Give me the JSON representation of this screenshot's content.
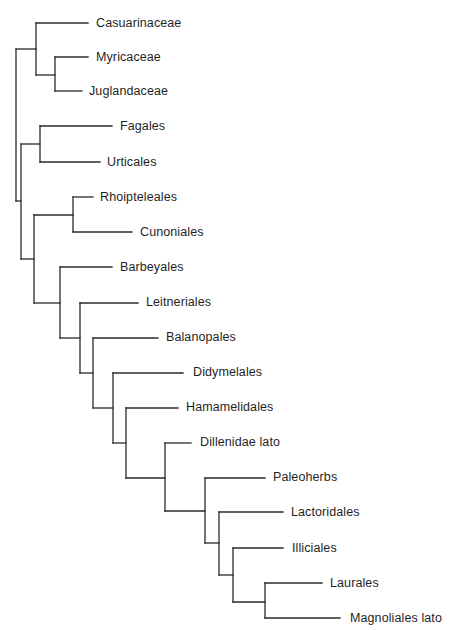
{
  "diagram": {
    "type": "cladogram",
    "line_color": "#2a2a2a",
    "text_color": "#1f1f1f",
    "taxa": [
      {
        "label": "Casuarinaceae",
        "x": 96,
        "y": 23
      },
      {
        "label": "Myricaceae",
        "x": 96,
        "y": 57
      },
      {
        "label": "Juglandaceae",
        "x": 89,
        "y": 91
      },
      {
        "label": "Fagales",
        "x": 120,
        "y": 126
      },
      {
        "label": "Urticales",
        "x": 107,
        "y": 162
      },
      {
        "label": "Rhoipteleales",
        "x": 100,
        "y": 197
      },
      {
        "label": "Cunoniales",
        "x": 140,
        "y": 232
      },
      {
        "label": "Barbeyales",
        "x": 120,
        "y": 267
      },
      {
        "label": "Leitneriales",
        "x": 146,
        "y": 302
      },
      {
        "label": "Balanopales",
        "x": 166,
        "y": 337
      },
      {
        "label": "Didymelales",
        "x": 193,
        "y": 372
      },
      {
        "label": "Hamamelidales",
        "x": 186,
        "y": 407
      },
      {
        "label": "Dillenidae lato",
        "x": 200,
        "y": 442
      },
      {
        "label": "Paleoherbs",
        "x": 273,
        "y": 477
      },
      {
        "label": "Lactoridales",
        "x": 291,
        "y": 512
      },
      {
        "label": "Illiciales",
        "x": 292,
        "y": 548
      },
      {
        "label": "Laurales",
        "x": 330,
        "y": 583
      },
      {
        "label": "Magnoliales lato",
        "x": 350,
        "y": 618
      }
    ],
    "segments": [
      [
        36,
        23,
        88,
        23
      ],
      [
        36,
        23,
        36,
        75
      ],
      [
        55,
        57,
        88,
        57
      ],
      [
        55,
        57,
        55,
        91
      ],
      [
        55,
        91,
        82,
        91
      ],
      [
        36,
        75,
        55,
        75
      ],
      [
        16,
        49,
        36,
        49
      ],
      [
        16,
        49,
        16,
        201
      ],
      [
        40,
        126,
        112,
        126
      ],
      [
        40,
        126,
        40,
        162
      ],
      [
        40,
        162,
        100,
        162
      ],
      [
        21,
        144,
        40,
        144
      ],
      [
        21,
        144,
        21,
        259
      ],
      [
        16,
        201,
        21,
        201
      ],
      [
        73,
        197,
        93,
        197
      ],
      [
        73,
        197,
        73,
        232
      ],
      [
        73,
        232,
        132,
        232
      ],
      [
        34,
        215,
        73,
        215
      ],
      [
        34,
        215,
        34,
        303
      ],
      [
        21,
        259,
        34,
        259
      ],
      [
        60,
        267,
        112,
        267
      ],
      [
        60,
        267,
        60,
        338
      ],
      [
        34,
        303,
        60,
        303
      ],
      [
        80,
        303,
        138,
        303
      ],
      [
        80,
        303,
        80,
        373
      ],
      [
        60,
        338,
        80,
        338
      ],
      [
        93,
        338,
        158,
        338
      ],
      [
        93,
        338,
        93,
        408
      ],
      [
        80,
        373,
        93,
        373
      ],
      [
        113,
        373,
        183,
        373
      ],
      [
        113,
        373,
        113,
        443
      ],
      [
        93,
        408,
        113,
        408
      ],
      [
        126,
        408,
        178,
        408
      ],
      [
        126,
        408,
        126,
        478
      ],
      [
        113,
        443,
        126,
        443
      ],
      [
        165,
        443,
        191,
        443
      ],
      [
        165,
        443,
        165,
        511
      ],
      [
        126,
        478,
        165,
        478
      ],
      [
        205,
        478,
        265,
        478
      ],
      [
        205,
        478,
        205,
        543
      ],
      [
        165,
        511,
        205,
        511
      ],
      [
        219,
        512,
        283,
        512
      ],
      [
        219,
        512,
        219,
        575
      ],
      [
        205,
        543,
        219,
        543
      ],
      [
        233,
        548,
        283,
        548
      ],
      [
        233,
        548,
        233,
        602
      ],
      [
        219,
        575,
        233,
        575
      ],
      [
        265,
        583,
        322,
        583
      ],
      [
        265,
        583,
        265,
        618
      ],
      [
        265,
        618,
        340,
        618
      ],
      [
        233,
        602,
        265,
        602
      ]
    ]
  }
}
